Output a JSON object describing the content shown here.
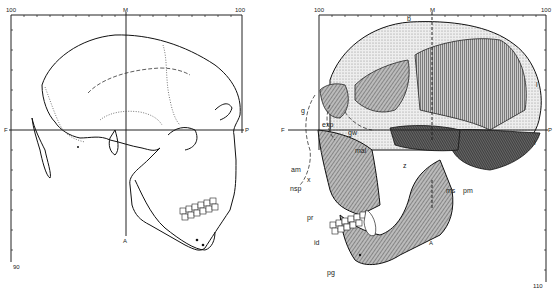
{
  "figure": {
    "left_panel": {
      "title": "outline-drawing",
      "scale_top_left": "100",
      "scale_top_mid": "M",
      "scale_top_right": "100",
      "scale_bottom_left": "90",
      "axis_left": "F",
      "axis_right": "P",
      "axis_bottom": "A"
    },
    "right_panel": {
      "title": "shaded-drawing",
      "scale_top_left": "100",
      "scale_top_mid": "M",
      "scale_top_right": "100",
      "scale_bottom_right": "110",
      "axis_left": "F",
      "axis_right": "P",
      "axis_bottom": "A",
      "labels": {
        "b": "b",
        "l": "l",
        "g": "g",
        "exp": "exp",
        "gw": "gw",
        "mal": "mal",
        "i": "i",
        "am": "am",
        "x": "x",
        "nsp": "nsp",
        "z": "z",
        "ms": "ms",
        "pm": "pm",
        "pr": "pr",
        "id": "id",
        "pg": "pg"
      }
    }
  }
}
